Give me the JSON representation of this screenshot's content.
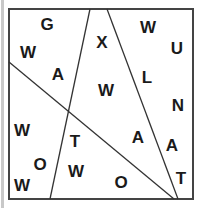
{
  "figure": {
    "type": "letter-puzzle",
    "box": {
      "x1": 9,
      "y1": 9,
      "x2": 193,
      "y2": 199
    },
    "colors": {
      "line": "#333333",
      "border": "#444444",
      "letter": "#1a1a1a",
      "background": "#ffffff"
    },
    "lines": [
      {
        "x1": 90,
        "y1": 9,
        "x2": 50,
        "y2": 199
      },
      {
        "x1": 107,
        "y1": 9,
        "x2": 178,
        "y2": 199
      },
      {
        "x1": 9,
        "y1": 62,
        "x2": 174,
        "y2": 199
      }
    ],
    "letters": [
      {
        "char": "G",
        "x": 47,
        "y": 24
      },
      {
        "char": "W",
        "x": 28,
        "y": 52
      },
      {
        "char": "A",
        "x": 58,
        "y": 74
      },
      {
        "char": "X",
        "x": 102,
        "y": 42
      },
      {
        "char": "W",
        "x": 148,
        "y": 27
      },
      {
        "char": "U",
        "x": 177,
        "y": 48
      },
      {
        "char": "L",
        "x": 147,
        "y": 77
      },
      {
        "char": "W",
        "x": 106,
        "y": 90
      },
      {
        "char": "N",
        "x": 178,
        "y": 105
      },
      {
        "char": "A",
        "x": 138,
        "y": 137
      },
      {
        "char": "A",
        "x": 172,
        "y": 145
      },
      {
        "char": "T",
        "x": 181,
        "y": 178
      },
      {
        "char": "O",
        "x": 121,
        "y": 182
      },
      {
        "char": "T",
        "x": 75,
        "y": 141
      },
      {
        "char": "W",
        "x": 76,
        "y": 171
      },
      {
        "char": "W",
        "x": 22,
        "y": 130
      },
      {
        "char": "O",
        "x": 40,
        "y": 164
      },
      {
        "char": "W",
        "x": 22,
        "y": 185
      }
    ]
  }
}
